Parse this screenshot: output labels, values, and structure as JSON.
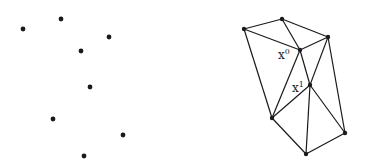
{
  "left_points": [
    [
      23,
      29
    ],
    [
      61,
      19
    ],
    [
      109,
      37
    ],
    [
      81,
      51
    ],
    [
      90,
      87
    ],
    [
      53,
      119
    ],
    [
      123,
      135
    ],
    [
      84,
      156
    ]
  ],
  "right_points": {
    "A": [
      244,
      29
    ],
    "B": [
      282,
      19
    ],
    "C": [
      328,
      37
    ],
    "D": [
      300,
      50
    ],
    "E": [
      310,
      85
    ],
    "F": [
      272,
      118
    ],
    "G": [
      345,
      133
    ],
    "H": [
      306,
      154
    ]
  },
  "edges": [
    [
      "A",
      "B"
    ],
    [
      "B",
      "C"
    ],
    [
      "A",
      "D"
    ],
    [
      "B",
      "D"
    ],
    [
      "D",
      "C"
    ],
    [
      "A",
      "F"
    ],
    [
      "D",
      "F"
    ],
    [
      "D",
      "E"
    ],
    [
      "C",
      "E"
    ],
    [
      "C",
      "G"
    ],
    [
      "E",
      "F"
    ],
    [
      "E",
      "H"
    ],
    [
      "E",
      "G"
    ],
    [
      "F",
      "H"
    ],
    [
      "H",
      "G"
    ]
  ],
  "labels": {
    "x0": {
      "base": "x",
      "sup": "0"
    },
    "x1": {
      "base": "x",
      "sup": "1"
    }
  },
  "colors": {
    "stroke": "#1a1a1a",
    "point": "#1a1a1a"
  }
}
